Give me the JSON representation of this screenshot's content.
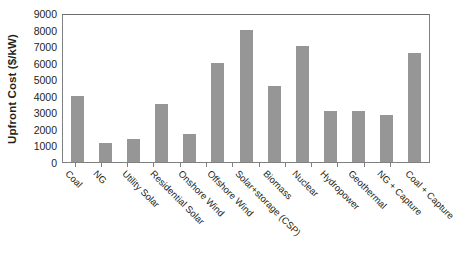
{
  "chart_data": {
    "type": "bar",
    "title": "",
    "xlabel": "",
    "ylabel": "Upfront Cost ($/kW)",
    "ylim": [
      0,
      9000
    ],
    "ytick_step": 1000,
    "yticks": [
      9000,
      8000,
      7000,
      6000,
      5000,
      4000,
      3000,
      2000,
      1000,
      0
    ],
    "grid": false,
    "legend": false,
    "bar_color": "#969696",
    "categories": [
      "Coal",
      "NG",
      "Utility Solar",
      "Residential Solar",
      "Onshore Wind",
      "Offshore Wind",
      "Solar+storage (CSP)",
      "Biomass",
      "Nuclear",
      "Hydropower",
      "Geothermal",
      "NG + Capture",
      "Coal + Capture"
    ],
    "values": [
      4000,
      1150,
      1400,
      3500,
      1700,
      6000,
      8000,
      4600,
      7000,
      3100,
      3100,
      2850,
      6600
    ]
  }
}
